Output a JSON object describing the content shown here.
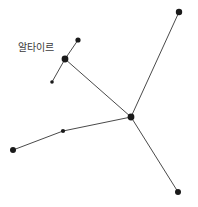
{
  "figure": {
    "name": "constellation-star-map",
    "width": 198,
    "height": 207,
    "background_color": "#ffffff",
    "line_color": "#4a4a4a",
    "star_color": "#1a1a1a",
    "label_color": "#3b3b3b"
  },
  "labels": [
    {
      "id": "altair-label",
      "text": "알타이르",
      "x": 18,
      "y": 42,
      "font_size": 10
    }
  ],
  "stars": [
    {
      "id": "star-top-right",
      "name": "top-right-star",
      "x": 179,
      "y": 12,
      "r": 3.2
    },
    {
      "id": "star-upper-small",
      "name": "upper-small-star",
      "x": 78,
      "y": 40,
      "r": 2.6
    },
    {
      "id": "star-altair",
      "name": "altair-star",
      "x": 65,
      "y": 59,
      "r": 3.4
    },
    {
      "id": "star-lower-small",
      "name": "lower-small-star",
      "x": 52,
      "y": 82,
      "r": 1.8
    },
    {
      "id": "star-hub",
      "name": "central-hub-star",
      "x": 131,
      "y": 117,
      "r": 3.4
    },
    {
      "id": "star-mid-left",
      "name": "mid-left-star",
      "x": 63,
      "y": 131,
      "r": 2.1
    },
    {
      "id": "star-far-left",
      "name": "far-left-star",
      "x": 13,
      "y": 150,
      "r": 3.0
    },
    {
      "id": "star-bottom-right",
      "name": "bottom-right-star",
      "x": 178,
      "y": 192,
      "r": 3.0
    }
  ],
  "lines": [
    {
      "id": "line-altair-upper",
      "name": "line-altair-to-upper-small",
      "x1": 65,
      "y1": 59,
      "x2": 78,
      "y2": 40
    },
    {
      "id": "line-altair-lower",
      "name": "line-altair-to-lower-small",
      "x1": 65,
      "y1": 59,
      "x2": 52,
      "y2": 82
    },
    {
      "id": "line-altair-hub",
      "name": "line-altair-to-hub",
      "x1": 65,
      "y1": 59,
      "x2": 131,
      "y2": 117
    },
    {
      "id": "line-hub-topright",
      "name": "line-hub-to-top-right",
      "x1": 131,
      "y1": 117,
      "x2": 179,
      "y2": 12
    },
    {
      "id": "line-hub-bottomright",
      "name": "line-hub-to-bottom-right",
      "x1": 131,
      "y1": 117,
      "x2": 178,
      "y2": 192
    },
    {
      "id": "line-hub-midleft",
      "name": "line-hub-to-mid-left",
      "x1": 131,
      "y1": 117,
      "x2": 63,
      "y2": 131
    },
    {
      "id": "line-midleft-farleft",
      "name": "line-mid-left-to-far-left",
      "x1": 63,
      "y1": 131,
      "x2": 13,
      "y2": 150
    }
  ]
}
